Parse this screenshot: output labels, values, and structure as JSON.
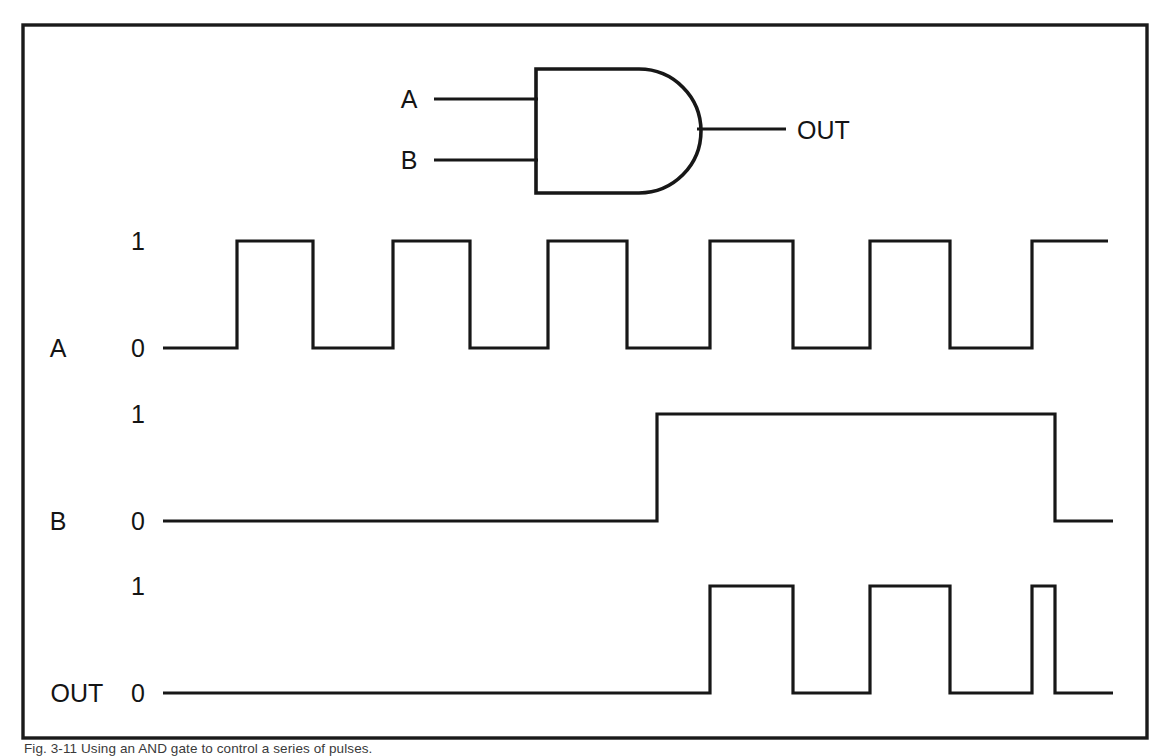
{
  "figure": {
    "caption": "Fig. 3-11  Using an AND gate to control a series of pulses.",
    "background_color": "#ffffff",
    "line_color": "#171717",
    "frame": {
      "x": 23,
      "y": 25,
      "width": 1124,
      "height": 713
    }
  },
  "gate": {
    "type": "AND",
    "input_labels": [
      "A",
      "B"
    ],
    "output_label": "OUT",
    "geometry": {
      "body_left": 536,
      "body_top": 69,
      "body_bottom": 193,
      "flat_right": 639,
      "tip_x": 697,
      "input_a_y": 99,
      "input_b_y": 160,
      "output_y": 129,
      "input_wire_start_x": 434,
      "output_wire_end_x": 786
    }
  },
  "waveforms": {
    "time_axis": {
      "start_x": 163,
      "end_x": 1140,
      "unit_px": 78
    },
    "rows": [
      {
        "name": "A",
        "label": "A",
        "label_x": 58,
        "level_high_label": "1",
        "level_low_label": "0",
        "y_high": 241,
        "y_low": 348,
        "start_level": 0,
        "end_level": 1,
        "transitions_x": [
          237,
          313,
          393,
          470,
          548,
          627,
          710,
          793,
          870,
          950,
          1032
        ],
        "description": "Square wave pulse train, 50% duty, 6 pulses"
      },
      {
        "name": "B",
        "label": "B",
        "label_x": 58,
        "level_high_label": "1",
        "level_low_label": "0",
        "y_high": 414,
        "y_low": 521,
        "start_level": 0,
        "end_level": 0,
        "transitions_x": [
          657,
          1055
        ],
        "description": "Enable signal: low, then high from 657 to 1055, then low"
      },
      {
        "name": "OUT",
        "label": "OUT",
        "label_x": 38,
        "level_high_label": "1",
        "level_low_label": "0",
        "y_high": 586,
        "y_low": 693,
        "start_level": 0,
        "end_level": 0,
        "transitions_x": [
          710,
          793,
          870,
          950,
          1032,
          1055
        ],
        "description": "A AND B: three gated pulses, last one truncated"
      }
    ],
    "level_label_x": 138,
    "axis_line_start_x": 163
  },
  "chart_data": {
    "type": "line",
    "xlabel": "time",
    "ylabel": "logic level",
    "ylim": [
      0,
      1
    ],
    "grid": false,
    "legend": "none",
    "series": [
      {
        "name": "A",
        "kind": "digital-waveform",
        "segments": [
          {
            "level": 0,
            "x_start": 163,
            "x_end": 237
          },
          {
            "level": 1,
            "x_start": 237,
            "x_end": 313
          },
          {
            "level": 0,
            "x_start": 313,
            "x_end": 393
          },
          {
            "level": 1,
            "x_start": 393,
            "x_end": 470
          },
          {
            "level": 0,
            "x_start": 470,
            "x_end": 548
          },
          {
            "level": 1,
            "x_start": 548,
            "x_end": 627
          },
          {
            "level": 0,
            "x_start": 627,
            "x_end": 710
          },
          {
            "level": 1,
            "x_start": 710,
            "x_end": 793
          },
          {
            "level": 0,
            "x_start": 793,
            "x_end": 870
          },
          {
            "level": 1,
            "x_start": 870,
            "x_end": 950
          },
          {
            "level": 0,
            "x_start": 950,
            "x_end": 1032
          },
          {
            "level": 1,
            "x_start": 1032,
            "x_end": 1108
          }
        ]
      },
      {
        "name": "B",
        "kind": "digital-waveform",
        "segments": [
          {
            "level": 0,
            "x_start": 163,
            "x_end": 657
          },
          {
            "level": 1,
            "x_start": 657,
            "x_end": 1055
          },
          {
            "level": 0,
            "x_start": 1055,
            "x_end": 1113
          }
        ]
      },
      {
        "name": "OUT",
        "kind": "digital-waveform",
        "segments": [
          {
            "level": 0,
            "x_start": 163,
            "x_end": 710
          },
          {
            "level": 1,
            "x_start": 710,
            "x_end": 793
          },
          {
            "level": 0,
            "x_start": 793,
            "x_end": 870
          },
          {
            "level": 1,
            "x_start": 870,
            "x_end": 950
          },
          {
            "level": 0,
            "x_start": 950,
            "x_end": 1032
          },
          {
            "level": 1,
            "x_start": 1032,
            "x_end": 1055
          },
          {
            "level": 0,
            "x_start": 1055,
            "x_end": 1113
          }
        ]
      }
    ],
    "truth_table": {
      "headers": [
        "A",
        "B",
        "OUT"
      ],
      "rows": [
        [
          0,
          0,
          0
        ],
        [
          0,
          1,
          0
        ],
        [
          1,
          0,
          0
        ],
        [
          1,
          1,
          1
        ]
      ]
    }
  },
  "labels": {
    "gate_input_a": "A",
    "gate_input_b": "B",
    "gate_output": "OUT",
    "row_a": "A",
    "row_b": "B",
    "row_out": "OUT",
    "one": "1",
    "zero": "0"
  }
}
